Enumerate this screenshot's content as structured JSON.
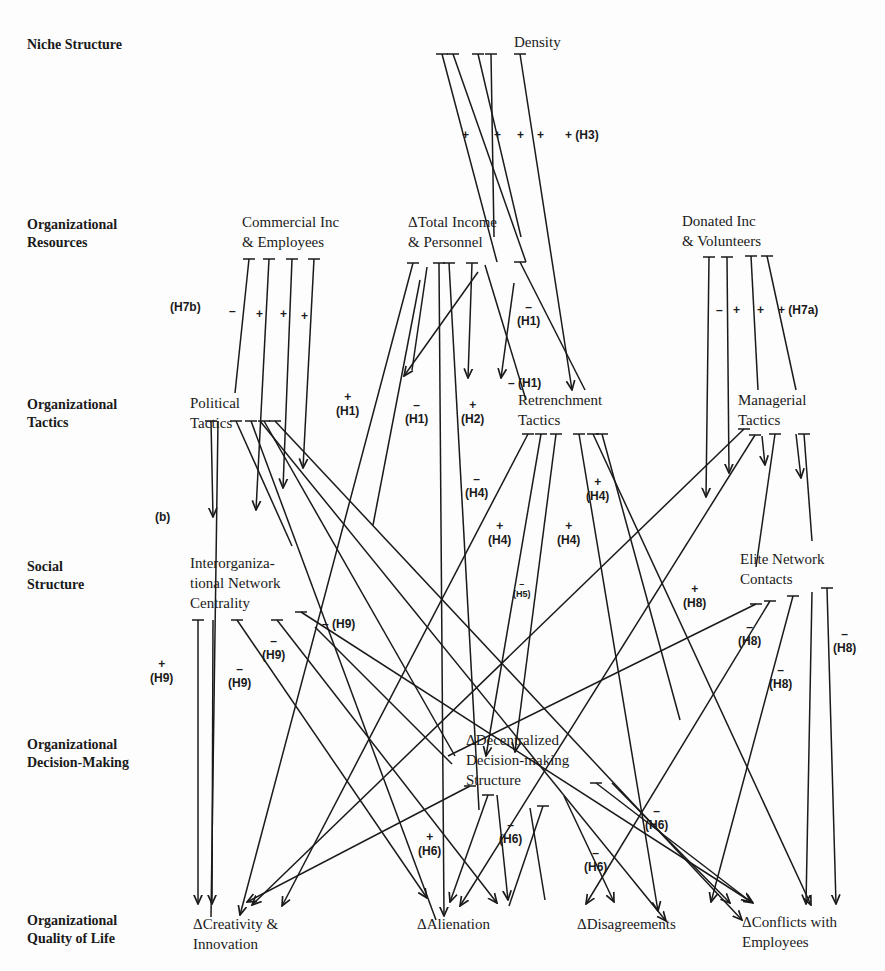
{
  "levels": [
    {
      "id": "niche",
      "label": "Niche Structure",
      "x": 27,
      "y": 36
    },
    {
      "id": "resources",
      "label": "Organizational\nResources",
      "x": 27,
      "y": 216
    },
    {
      "id": "tactics",
      "label": "Organizational\nTactics",
      "x": 27,
      "y": 396
    },
    {
      "id": "social",
      "label": "Social\nStructure",
      "x": 27,
      "y": 558
    },
    {
      "id": "decision",
      "label": "Organizational\nDecision-Making",
      "x": 27,
      "y": 736
    },
    {
      "id": "qol",
      "label": "Organizational\nQuality of Life",
      "x": 27,
      "y": 912
    }
  ],
  "nodes": [
    {
      "id": "density",
      "label": "Density",
      "x": 514,
      "y": 32
    },
    {
      "id": "commercial",
      "label": "Commercial Inc\n& Employees",
      "x": 242,
      "y": 212
    },
    {
      "id": "total_income",
      "label": "ΔTotal Income\n& Personnel",
      "x": 408,
      "y": 212
    },
    {
      "id": "donated",
      "label": "Donated Inc\n& Volunteers",
      "x": 682,
      "y": 211
    },
    {
      "id": "political",
      "label": "Political\nTactics",
      "x": 190,
      "y": 393
    },
    {
      "id": "retrenchment",
      "label": "Retrenchment\nTactics",
      "x": 518,
      "y": 390
    },
    {
      "id": "managerial",
      "label": "Managerial\nTactics",
      "x": 738,
      "y": 390
    },
    {
      "id": "interorg",
      "label": "Interorganiza-\ntional Network\nCentrality",
      "x": 190,
      "y": 553
    },
    {
      "id": "elite",
      "label": "Elite Network\nContacts",
      "x": 740,
      "y": 549
    },
    {
      "id": "decentralized",
      "label": "ΔDecentralized\nDecision-making\nStructure",
      "x": 466,
      "y": 730
    },
    {
      "id": "creativity",
      "label": "ΔCreativity &\nInnovation",
      "x": 193,
      "y": 914
    },
    {
      "id": "alienation",
      "label": "ΔAlienation",
      "x": 417,
      "y": 914
    },
    {
      "id": "disagreements",
      "label": "ΔDisagreements",
      "x": 577,
      "y": 914
    },
    {
      "id": "conflicts",
      "label": "ΔConflicts with\nEmployees",
      "x": 742,
      "y": 912
    }
  ],
  "signs": [
    {
      "text": "+",
      "x": 462,
      "y": 128
    },
    {
      "text": "+",
      "x": 494,
      "y": 128
    },
    {
      "text": "+",
      "x": 517,
      "y": 128
    },
    {
      "text": "+",
      "x": 537,
      "y": 128
    },
    {
      "text": "+ (H3)",
      "x": 565,
      "y": 128
    },
    {
      "text": "(H7b)",
      "x": 170,
      "y": 300
    },
    {
      "text": "–",
      "x": 229,
      "y": 304
    },
    {
      "text": "+",
      "x": 256,
      "y": 307
    },
    {
      "text": "+",
      "x": 280,
      "y": 307
    },
    {
      "text": "+",
      "x": 301,
      "y": 309
    },
    {
      "text": "–",
      "x": 716,
      "y": 303
    },
    {
      "text": "+",
      "x": 733,
      "y": 303
    },
    {
      "text": "+",
      "x": 757,
      "y": 303
    },
    {
      "text": "+ (H7a)",
      "x": 778,
      "y": 303
    },
    {
      "text": "–\n(H1)",
      "x": 517,
      "y": 300
    },
    {
      "text": "– (H1)",
      "x": 508,
      "y": 376
    },
    {
      "text": "+\n(H1)",
      "x": 336,
      "y": 390
    },
    {
      "text": "–\n(H1)",
      "x": 405,
      "y": 398
    },
    {
      "text": "+\n(H2)",
      "x": 461,
      "y": 398
    },
    {
      "text": "–\n(H4)",
      "x": 465,
      "y": 472
    },
    {
      "text": "+\n(H4)",
      "x": 586,
      "y": 475
    },
    {
      "text": "+\n(H4)",
      "x": 488,
      "y": 519
    },
    {
      "text": "+\n(H4)",
      "x": 557,
      "y": 519
    },
    {
      "text": "–\n(H5)",
      "x": 513,
      "y": 579,
      "small": true
    },
    {
      "text": "(b)",
      "x": 155,
      "y": 510
    },
    {
      "text": "+\n(H8)",
      "x": 683,
      "y": 582
    },
    {
      "text": "–\n(H8)",
      "x": 738,
      "y": 620
    },
    {
      "text": "–\n(H8)",
      "x": 769,
      "y": 663
    },
    {
      "text": "–\n(H8)",
      "x": 833,
      "y": 627
    },
    {
      "text": "– (H9)",
      "x": 322,
      "y": 617
    },
    {
      "text": "–\n(H9)",
      "x": 262,
      "y": 634
    },
    {
      "text": "+\n(H9)",
      "x": 150,
      "y": 657
    },
    {
      "text": "–\n(H9)",
      "x": 228,
      "y": 662
    },
    {
      "text": "–\n(H6)",
      "x": 499,
      "y": 818
    },
    {
      "text": "–\n(H6)",
      "x": 645,
      "y": 804
    },
    {
      "text": "+\n(H6)",
      "x": 418,
      "y": 830
    },
    {
      "text": "–\n(H6)",
      "x": 584,
      "y": 846
    }
  ],
  "edges": [
    [
      442,
      54,
      497,
      262,
      "none"
    ],
    [
      453,
      54,
      526,
      262,
      "none"
    ],
    [
      478,
      54,
      521,
      237,
      "none"
    ],
    [
      491,
      54,
      494,
      237,
      "none"
    ],
    [
      520,
      54,
      572,
      390,
      "arrow"
    ],
    [
      249,
      259,
      235,
      393,
      "none"
    ],
    [
      269,
      259,
      256,
      510,
      "arrow"
    ],
    [
      292,
      259,
      283,
      488,
      "arrow"
    ],
    [
      314,
      259,
      303,
      468,
      "arrow"
    ],
    [
      709,
      257,
      706,
      497,
      "arrow"
    ],
    [
      727,
      257,
      729,
      473,
      "arrow"
    ],
    [
      751,
      256,
      758,
      390,
      "none"
    ],
    [
      767,
      256,
      796,
      390,
      "none"
    ],
    [
      413,
      263,
      240,
      915,
      "arrow"
    ],
    [
      427,
      267,
      412,
      370,
      "none"
    ],
    [
      412,
      370,
      412,
      370,
      "none"
    ],
    [
      439,
      263,
      444,
      916,
      "arrow"
    ],
    [
      449,
      263,
      479,
      810,
      "none"
    ],
    [
      472,
      263,
      468,
      378,
      "arrow"
    ],
    [
      478,
      272,
      404,
      376,
      "arrow"
    ],
    [
      485,
      265,
      526,
      400,
      "none"
    ],
    [
      520,
      262,
      585,
      390,
      "none"
    ],
    [
      514,
      283,
      501,
      378,
      "arrow"
    ],
    [
      420,
      280,
      373,
      525,
      "none"
    ],
    [
      211,
      421,
      213,
      517,
      "arrow"
    ],
    [
      218,
      421,
      211,
      917,
      "none"
    ],
    [
      236,
      421,
      292,
      546,
      "none"
    ],
    [
      251,
      421,
      436,
      920,
      "none"
    ],
    [
      264,
      421,
      455,
      756,
      "none"
    ],
    [
      260,
      421,
      666,
      921,
      "arrow"
    ],
    [
      275,
      421,
      742,
      920,
      "arrow"
    ],
    [
      528,
      434,
      282,
      906,
      "arrow"
    ],
    [
      541,
      434,
      486,
      756,
      "arrow"
    ],
    [
      556,
      434,
      515,
      752,
      "arrow"
    ],
    [
      579,
      434,
      658,
      911,
      "arrow"
    ],
    [
      593,
      434,
      811,
      905,
      "arrow"
    ],
    [
      602,
      434,
      680,
      720,
      "none"
    ],
    [
      744,
      429,
      252,
      905,
      "arrow"
    ],
    [
      755,
      435,
      460,
      906,
      "arrow"
    ],
    [
      762,
      436,
      765,
      465,
      "arrow"
    ],
    [
      775,
      434,
      756,
      567,
      "none"
    ],
    [
      796,
      434,
      801,
      478,
      "arrow"
    ],
    [
      804,
      434,
      812,
      541,
      "none"
    ],
    [
      198,
      620,
      198,
      904,
      "arrow"
    ],
    [
      213,
      620,
      212,
      904,
      "arrow"
    ],
    [
      237,
      620,
      427,
      898,
      "arrow"
    ],
    [
      277,
      620,
      497,
      903,
      "arrow"
    ],
    [
      301,
      612,
      753,
      903,
      "arrow"
    ],
    [
      315,
      627,
      452,
      764,
      "none"
    ],
    [
      756,
      604,
      448,
      756,
      "none"
    ],
    [
      770,
      601,
      586,
      904,
      "arrow"
    ],
    [
      793,
      596,
      711,
      902,
      "arrow"
    ],
    [
      812,
      592,
      806,
      904,
      "arrow"
    ],
    [
      827,
      588,
      836,
      904,
      "arrow"
    ],
    [
      470,
      786,
      247,
      902,
      "arrow"
    ],
    [
      488,
      795,
      450,
      902,
      "arrow"
    ],
    [
      497,
      795,
      508,
      900,
      "arrow"
    ],
    [
      543,
      806,
      509,
      906,
      "none"
    ],
    [
      564,
      796,
      614,
      902,
      "arrow"
    ],
    [
      612,
      783,
      730,
      903,
      "arrow"
    ],
    [
      596,
      783,
      751,
      902,
      "arrow"
    ],
    [
      530,
      808,
      545,
      900,
      "none"
    ]
  ],
  "tee_marks": [
    [
      442,
      54
    ],
    [
      453,
      54
    ],
    [
      478,
      54
    ],
    [
      491,
      54
    ],
    [
      520,
      54
    ],
    [
      249,
      259
    ],
    [
      269,
      259
    ],
    [
      292,
      259
    ],
    [
      314,
      259
    ],
    [
      709,
      257
    ],
    [
      727,
      257
    ],
    [
      751,
      256
    ],
    [
      767,
      256
    ],
    [
      413,
      263
    ],
    [
      439,
      263
    ],
    [
      449,
      263
    ],
    [
      472,
      263
    ],
    [
      520,
      262
    ],
    [
      211,
      421
    ],
    [
      236,
      421
    ],
    [
      251,
      421
    ],
    [
      264,
      421
    ],
    [
      275,
      421
    ],
    [
      528,
      434
    ],
    [
      541,
      434
    ],
    [
      556,
      434
    ],
    [
      579,
      434
    ],
    [
      593,
      434
    ],
    [
      602,
      434
    ],
    [
      744,
      429
    ],
    [
      755,
      435
    ],
    [
      775,
      434
    ],
    [
      804,
      434
    ],
    [
      198,
      620
    ],
    [
      237,
      620
    ],
    [
      277,
      620
    ],
    [
      301,
      612
    ],
    [
      756,
      604
    ],
    [
      770,
      601
    ],
    [
      793,
      596
    ],
    [
      827,
      588
    ],
    [
      470,
      786
    ],
    [
      488,
      795
    ],
    [
      543,
      806
    ],
    [
      596,
      783
    ]
  ],
  "colors": {
    "ink": "#1a1a1a",
    "background": "#fdfdfd"
  }
}
